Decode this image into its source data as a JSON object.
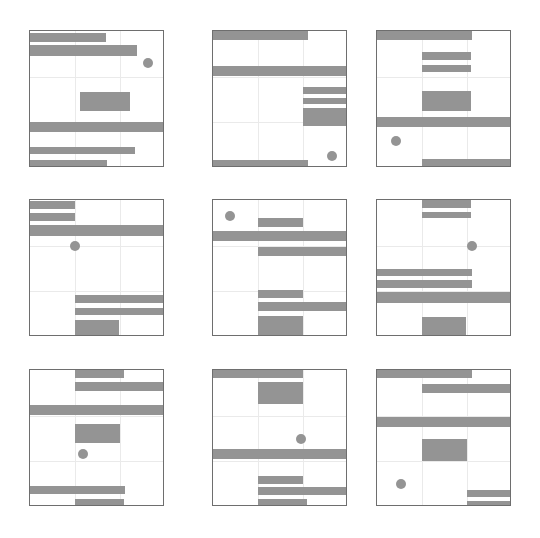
{
  "figure": {
    "width": 540,
    "height": 538,
    "background_color": "#ffffff",
    "shape_color": "#949494",
    "border_color": "#6e6e6e",
    "gridline_color": "#eaeaea",
    "rows": 3,
    "cols": 3,
    "panel_count": 9
  },
  "chart_data": {
    "type": "heatmap",
    "title": "",
    "subtitle": "",
    "xlabel": "",
    "ylabel": "",
    "grid": true,
    "legend": "none",
    "panel_layout": {
      "rows": 3,
      "cols": 3
    },
    "panel_geometry": {
      "panel_width": 135,
      "panel_height": 137,
      "x_positions": [
        29,
        212,
        376
      ],
      "y_positions": [
        30,
        199,
        369
      ],
      "gridline_fractions_x": [
        0.333,
        0.667
      ],
      "gridline_fractions_y": [
        0.333,
        0.667
      ]
    },
    "panels": [
      {
        "index": 1,
        "name": "panel-1",
        "row": 1,
        "col": 1,
        "bars": [
          {
            "x": 0.0,
            "y": 0.015,
            "w": 0.56,
            "h": 0.062
          },
          {
            "x": 0.0,
            "y": 0.105,
            "w": 0.79,
            "h": 0.075
          },
          {
            "x": 0.37,
            "y": 0.445,
            "w": 0.37,
            "h": 0.14
          },
          {
            "x": 0.0,
            "y": 0.665,
            "w": 1.0,
            "h": 0.072
          },
          {
            "x": 0.0,
            "y": 0.845,
            "w": 0.78,
            "h": 0.055
          },
          {
            "x": 0.0,
            "y": 0.945,
            "w": 0.57,
            "h": 0.055
          }
        ],
        "dot": {
          "x": 0.875,
          "y": 0.235,
          "r": 5
        }
      },
      {
        "index": 2,
        "name": "panel-2",
        "row": 1,
        "col": 2,
        "bars": [
          {
            "x": 0.0,
            "y": 0.0,
            "w": 0.7,
            "h": 0.065
          },
          {
            "x": 0.0,
            "y": 0.255,
            "w": 1.0,
            "h": 0.075
          },
          {
            "x": 0.67,
            "y": 0.41,
            "w": 0.33,
            "h": 0.048
          },
          {
            "x": 0.67,
            "y": 0.487,
            "w": 0.33,
            "h": 0.048
          },
          {
            "x": 0.67,
            "y": 0.565,
            "w": 0.33,
            "h": 0.125
          },
          {
            "x": 0.0,
            "y": 0.945,
            "w": 0.7,
            "h": 0.055
          }
        ],
        "dot": {
          "x": 0.885,
          "y": 0.915,
          "r": 5
        }
      },
      {
        "index": 3,
        "name": "panel-3",
        "row": 1,
        "col": 3,
        "bars": [
          {
            "x": 0.0,
            "y": 0.0,
            "w": 0.7,
            "h": 0.065
          },
          {
            "x": 0.33,
            "y": 0.155,
            "w": 0.37,
            "h": 0.055
          },
          {
            "x": 0.33,
            "y": 0.245,
            "w": 0.37,
            "h": 0.055
          },
          {
            "x": 0.33,
            "y": 0.44,
            "w": 0.37,
            "h": 0.145
          },
          {
            "x": 0.0,
            "y": 0.625,
            "w": 1.0,
            "h": 0.075
          },
          {
            "x": 0.33,
            "y": 0.935,
            "w": 0.67,
            "h": 0.065
          }
        ],
        "dot": {
          "x": 0.14,
          "y": 0.8,
          "r": 5
        }
      },
      {
        "index": 4,
        "name": "panel-4",
        "row": 2,
        "col": 1,
        "bars": [
          {
            "x": 0.0,
            "y": 0.01,
            "w": 0.33,
            "h": 0.058
          },
          {
            "x": 0.0,
            "y": 0.095,
            "w": 0.33,
            "h": 0.058
          },
          {
            "x": 0.0,
            "y": 0.185,
            "w": 1.0,
            "h": 0.075
          },
          {
            "x": 0.33,
            "y": 0.695,
            "w": 0.67,
            "h": 0.06
          },
          {
            "x": 0.33,
            "y": 0.785,
            "w": 0.67,
            "h": 0.058
          },
          {
            "x": 0.33,
            "y": 0.875,
            "w": 0.33,
            "h": 0.125
          }
        ],
        "dot": {
          "x": 0.335,
          "y": 0.335,
          "r": 5
        }
      },
      {
        "index": 5,
        "name": "panel-5",
        "row": 2,
        "col": 2,
        "bars": [
          {
            "x": 0.33,
            "y": 0.135,
            "w": 0.34,
            "h": 0.06
          },
          {
            "x": 0.0,
            "y": 0.225,
            "w": 1.0,
            "h": 0.075
          },
          {
            "x": 0.33,
            "y": 0.345,
            "w": 0.67,
            "h": 0.065
          },
          {
            "x": 0.33,
            "y": 0.66,
            "w": 0.34,
            "h": 0.055
          },
          {
            "x": 0.33,
            "y": 0.745,
            "w": 0.67,
            "h": 0.062
          },
          {
            "x": 0.33,
            "y": 0.845,
            "w": 0.34,
            "h": 0.155
          }
        ],
        "dot": {
          "x": 0.125,
          "y": 0.115,
          "r": 5
        }
      },
      {
        "index": 6,
        "name": "panel-6",
        "row": 2,
        "col": 3,
        "bars": [
          {
            "x": 0.33,
            "y": 0.0,
            "w": 0.37,
            "h": 0.055
          },
          {
            "x": 0.33,
            "y": 0.085,
            "w": 0.37,
            "h": 0.045
          },
          {
            "x": 0.0,
            "y": 0.5,
            "w": 0.7,
            "h": 0.058
          },
          {
            "x": 0.0,
            "y": 0.585,
            "w": 0.7,
            "h": 0.058
          },
          {
            "x": 0.0,
            "y": 0.675,
            "w": 1.0,
            "h": 0.075
          },
          {
            "x": 0.33,
            "y": 0.855,
            "w": 0.33,
            "h": 0.145
          }
        ],
        "dot": {
          "x": 0.705,
          "y": 0.335,
          "r": 5
        }
      },
      {
        "index": 7,
        "name": "panel-7",
        "row": 3,
        "col": 1,
        "bars": [
          {
            "x": 0.33,
            "y": 0.0,
            "w": 0.37,
            "h": 0.058
          },
          {
            "x": 0.33,
            "y": 0.09,
            "w": 0.67,
            "h": 0.062
          },
          {
            "x": 0.0,
            "y": 0.255,
            "w": 1.0,
            "h": 0.075
          },
          {
            "x": 0.33,
            "y": 0.395,
            "w": 0.34,
            "h": 0.14
          },
          {
            "x": 0.0,
            "y": 0.845,
            "w": 0.7,
            "h": 0.058
          },
          {
            "x": 0.33,
            "y": 0.945,
            "w": 0.37,
            "h": 0.055
          }
        ],
        "dot": {
          "x": 0.39,
          "y": 0.61,
          "r": 5
        }
      },
      {
        "index": 8,
        "name": "panel-8",
        "row": 3,
        "col": 2,
        "bars": [
          {
            "x": 0.0,
            "y": 0.0,
            "w": 0.67,
            "h": 0.058
          },
          {
            "x": 0.33,
            "y": 0.085,
            "w": 0.34,
            "h": 0.165
          },
          {
            "x": 0.0,
            "y": 0.575,
            "w": 1.0,
            "h": 0.075
          },
          {
            "x": 0.33,
            "y": 0.775,
            "w": 0.34,
            "h": 0.055
          },
          {
            "x": 0.33,
            "y": 0.855,
            "w": 0.67,
            "h": 0.058
          },
          {
            "x": 0.33,
            "y": 0.945,
            "w": 0.37,
            "h": 0.055
          }
        ],
        "dot": {
          "x": 0.655,
          "y": 0.5,
          "r": 5
        }
      },
      {
        "index": 9,
        "name": "panel-9",
        "row": 3,
        "col": 3,
        "bars": [
          {
            "x": 0.0,
            "y": 0.0,
            "w": 0.7,
            "h": 0.062
          },
          {
            "x": 0.33,
            "y": 0.105,
            "w": 0.67,
            "h": 0.062
          },
          {
            "x": 0.0,
            "y": 0.345,
            "w": 1.0,
            "h": 0.072
          },
          {
            "x": 0.33,
            "y": 0.5,
            "w": 0.34,
            "h": 0.165
          },
          {
            "x": 0.67,
            "y": 0.875,
            "w": 0.33,
            "h": 0.05
          },
          {
            "x": 0.67,
            "y": 0.955,
            "w": 0.33,
            "h": 0.045
          }
        ],
        "dot": {
          "x": 0.175,
          "y": 0.83,
          "r": 5
        }
      }
    ]
  }
}
